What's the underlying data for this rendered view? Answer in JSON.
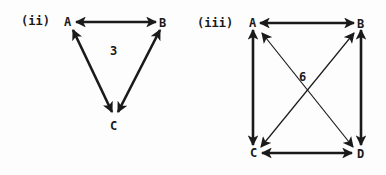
{
  "diagrams": [
    {
      "label": "(ii)",
      "weight": "3",
      "nodes": [
        {
          "id": "A",
          "label": "A"
        },
        {
          "id": "B",
          "label": "B"
        },
        {
          "id": "C",
          "label": "C"
        }
      ],
      "edges": [
        {
          "from": "A",
          "to": "B",
          "type": "bidirectional",
          "style": "thick"
        },
        {
          "from": "A",
          "to": "C",
          "type": "bidirectional",
          "style": "thick"
        },
        {
          "from": "B",
          "to": "C",
          "type": "bidirectional",
          "style": "thick"
        }
      ]
    },
    {
      "label": "(iii)",
      "weight": "6",
      "nodes": [
        {
          "id": "A",
          "label": "A"
        },
        {
          "id": "B",
          "label": "B"
        },
        {
          "id": "C",
          "label": "C"
        },
        {
          "id": "D",
          "label": "D"
        }
      ],
      "edges": [
        {
          "from": "A",
          "to": "B",
          "type": "bidirectional",
          "style": "thick"
        },
        {
          "from": "A",
          "to": "C",
          "type": "bidirectional",
          "style": "thick"
        },
        {
          "from": "B",
          "to": "D",
          "type": "bidirectional",
          "style": "thick"
        },
        {
          "from": "C",
          "to": "D",
          "type": "bidirectional",
          "style": "thick"
        },
        {
          "from": "A",
          "to": "D",
          "type": "bidirectional",
          "style": "thin"
        },
        {
          "from": "B",
          "to": "C",
          "type": "bidirectional",
          "style": "thin"
        }
      ]
    }
  ],
  "colors": {
    "ink": "#1a1a1a",
    "paper": "#fdfdfd"
  }
}
